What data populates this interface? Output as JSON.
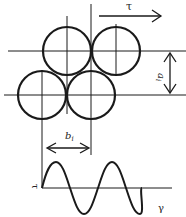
{
  "diagram": {
    "title": "",
    "labels": {
      "shear_stress_top": "τ",
      "vertical_spacing": "a",
      "vertical_spacing_sub": "i",
      "horizontal_spacing": "b",
      "horizontal_spacing_sub": "i",
      "wave_y_axis": "τ",
      "wave_x_axis": "γ"
    },
    "circles": [
      {
        "id": "top-left",
        "cx": 67,
        "cy": 51,
        "r": 24
      },
      {
        "id": "top-right",
        "cx": 116,
        "cy": 51,
        "r": 24
      },
      {
        "id": "bottom-left",
        "cx": 42,
        "cy": 95,
        "r": 24
      },
      {
        "id": "bottom-right",
        "cx": 91,
        "cy": 95,
        "r": 24
      }
    ],
    "colors": {
      "stroke": "#1a1a1a",
      "background": "#ffffff"
    }
  }
}
